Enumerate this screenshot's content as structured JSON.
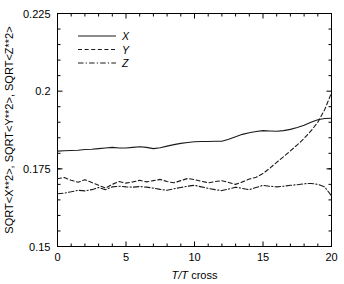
{
  "chart_data": {
    "type": "line",
    "title": "",
    "xlabel": "T/T cross",
    "xlabel_italic_part": "T/T",
    "xlabel_plain_part": " cross",
    "ylabel": "SQRT<X**2>, SQRT<Y**2>, SQRT<Z**2>",
    "xlim": [
      0,
      20
    ],
    "ylim": [
      0.15,
      0.225
    ],
    "xticks": [
      0,
      5,
      10,
      15,
      20
    ],
    "xtick_labels": [
      "0",
      "5",
      "10",
      "15",
      "20"
    ],
    "yticks": [
      0.15,
      0.175,
      0.2,
      0.225
    ],
    "ytick_labels": [
      "0.15",
      "0.175",
      "0.2",
      "0.225"
    ],
    "x_minor_tick_step": 1,
    "y_minor_tick_step": 0.005,
    "grid": false,
    "legend_position": "upper-left-inside",
    "line_color": "#1a1a1a",
    "background_color": "#ffffff",
    "x": [
      0,
      0.5,
      1,
      1.5,
      2,
      2.5,
      3,
      3.5,
      4,
      4.5,
      5,
      5.5,
      6,
      6.5,
      7,
      7.5,
      8,
      8.5,
      9,
      9.5,
      10,
      10.5,
      11,
      11.5,
      12,
      12.5,
      13,
      13.5,
      14,
      14.5,
      15,
      15.5,
      16,
      16.5,
      17,
      17.5,
      18,
      18.5,
      19,
      19.5,
      20
    ],
    "series": [
      {
        "name": "X",
        "label": "X",
        "dash": "solid",
        "values": [
          0.1807,
          0.1808,
          0.1809,
          0.181,
          0.1812,
          0.1813,
          0.1815,
          0.1817,
          0.1819,
          0.1817,
          0.1817,
          0.1819,
          0.1821,
          0.1819,
          0.1815,
          0.1818,
          0.1823,
          0.1828,
          0.1832,
          0.1835,
          0.1837,
          0.1838,
          0.1838,
          0.1839,
          0.1839,
          0.1845,
          0.1853,
          0.1861,
          0.1866,
          0.187,
          0.1873,
          0.1872,
          0.1871,
          0.1873,
          0.1877,
          0.1883,
          0.189,
          0.19,
          0.1908,
          0.1912,
          0.1913
        ]
      },
      {
        "name": "Y",
        "label": "Y",
        "dash": "dashed",
        "values": [
          0.1718,
          0.1722,
          0.1713,
          0.1707,
          0.1715,
          0.1706,
          0.1697,
          0.1688,
          0.17,
          0.1709,
          0.1704,
          0.1708,
          0.1713,
          0.1708,
          0.1712,
          0.1716,
          0.1709,
          0.1705,
          0.1712,
          0.1719,
          0.1715,
          0.171,
          0.1705,
          0.1709,
          0.1712,
          0.1706,
          0.17,
          0.1708,
          0.1717,
          0.1723,
          0.1735,
          0.1752,
          0.1771,
          0.1789,
          0.1808,
          0.1827,
          0.1848,
          0.1872,
          0.19,
          0.194,
          0.1995
        ]
      },
      {
        "name": "Z",
        "label": "Z",
        "dash": "dashdot",
        "values": [
          0.167,
          0.1672,
          0.1676,
          0.1681,
          0.1679,
          0.1683,
          0.169,
          0.1683,
          0.1692,
          0.1694,
          0.1692,
          0.1691,
          0.1693,
          0.1691,
          0.1688,
          0.1684,
          0.1681,
          0.1686,
          0.169,
          0.1694,
          0.1697,
          0.1692,
          0.1687,
          0.1683,
          0.168,
          0.1685,
          0.1691,
          0.1687,
          0.1683,
          0.169,
          0.1697,
          0.1694,
          0.1692,
          0.1694,
          0.1697,
          0.1699,
          0.1702,
          0.1703,
          0.17,
          0.1692,
          0.1663
        ]
      }
    ]
  },
  "legend": {
    "items": [
      {
        "label": "X",
        "dash": "solid"
      },
      {
        "label": "Y",
        "dash": "dashed"
      },
      {
        "label": "Z",
        "dash": "dashdot"
      }
    ]
  }
}
